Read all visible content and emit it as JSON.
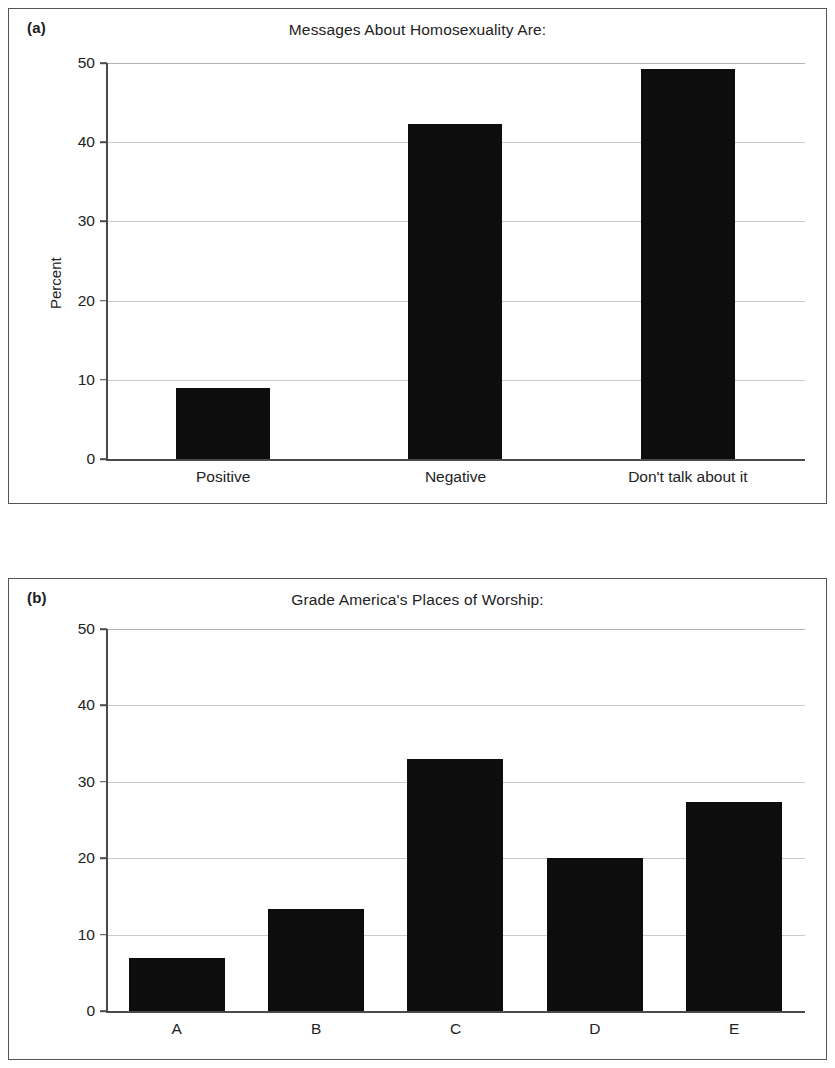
{
  "figure": {
    "panels": [
      {
        "panel_label": "(a)",
        "title": "Messages About Homosexuality Are:",
        "ylabel": "Percent",
        "yticks": [
          "50",
          "40",
          "30",
          "20",
          "10",
          "0"
        ],
        "xticks": [
          "Positive",
          "Negative",
          "Don't talk about it"
        ]
      },
      {
        "panel_label": "(b)",
        "title": "Grade America's Places of Worship:",
        "ylabel": "Percent",
        "yticks": [
          "50",
          "40",
          "30",
          "20",
          "10",
          "0"
        ],
        "xticks": [
          "A",
          "B",
          "C",
          "D",
          "E"
        ]
      }
    ]
  },
  "chart_data": [
    {
      "type": "bar",
      "title": "Messages About Homosexuality Are:",
      "panel": "(a)",
      "categories": [
        "Positive",
        "Negative",
        "Don't talk about it"
      ],
      "values": [
        9,
        42.3,
        49.2
      ],
      "xlabel": "",
      "ylabel": "Percent",
      "ylim": [
        0,
        50
      ],
      "yticks": [
        0,
        10,
        20,
        30,
        40,
        50
      ],
      "grid": true,
      "legend": false,
      "bar_color": "#0d0d0d"
    },
    {
      "type": "bar",
      "title": "Grade America's Places of Worship:",
      "panel": "(b)",
      "categories": [
        "A",
        "B",
        "C",
        "D",
        "E"
      ],
      "values": [
        7,
        13.3,
        33,
        20,
        27.3
      ],
      "xlabel": "",
      "ylabel": "Percent",
      "ylim": [
        0,
        50
      ],
      "yticks": [
        0,
        10,
        20,
        30,
        40,
        50
      ],
      "grid": true,
      "legend": false,
      "bar_color": "#0d0d0d"
    }
  ]
}
